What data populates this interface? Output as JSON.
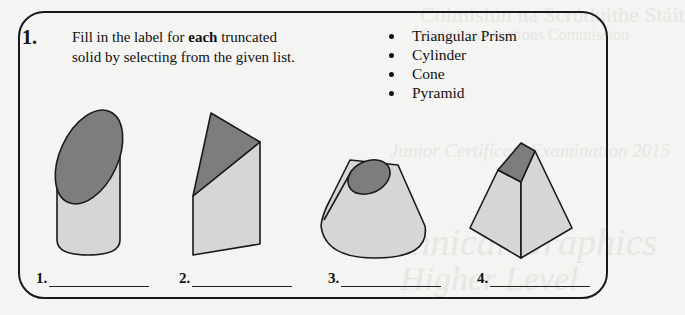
{
  "question": {
    "number": "1.",
    "instruction_prefix": "Fill in the label for ",
    "instruction_bold": "each",
    "instruction_suffix": " truncated solid by selecting from the given list."
  },
  "options": [
    "Triangular Prism",
    "Cylinder",
    "Cone",
    "Pyramid"
  ],
  "figures": [
    {
      "id": 1,
      "shape": "truncated-cylinder"
    },
    {
      "id": 2,
      "shape": "truncated-triangular-prism"
    },
    {
      "id": 3,
      "shape": "truncated-cone"
    },
    {
      "id": 4,
      "shape": "truncated-pyramid"
    }
  ],
  "answers": [
    {
      "label": "1.",
      "value": ""
    },
    {
      "label": "2.",
      "value": ""
    },
    {
      "label": "3.",
      "value": ""
    },
    {
      "label": "4.",
      "value": ""
    }
  ],
  "colors": {
    "cut_face": "#7d7d7d",
    "body": "#d6d6d6",
    "outline": "#1a1a1a"
  }
}
